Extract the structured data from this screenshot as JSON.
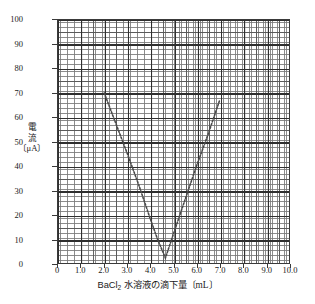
{
  "chart_data": {
    "type": "line",
    "title": "",
    "subtitle": "",
    "xlabel": "BaCl2 水溶液の滴下量〔mL〕",
    "xlabel_main": "BaCl",
    "xlabel_sub": "2",
    "xlabel_rest": " 水溶液の滴下量〔mL〕",
    "ylabel": "電流〔μA〕",
    "ylabel_line1": "電",
    "ylabel_line2": "流",
    "ylabel_line3": "〔μA〕",
    "xlim": [
      0,
      10
    ],
    "ylim": [
      0,
      100
    ],
    "x_major_step": 1.0,
    "y_major_step": 10,
    "x_minor_step": 0.1,
    "y_minor_step": 1,
    "grid": true,
    "grid_style": "graph-paper",
    "legend": false,
    "marker": "dotted-line",
    "line_color": "#4a4a4a",
    "xticklabels": [
      "0",
      "1.0",
      "2.0",
      "3.0",
      "4.0",
      "5.0",
      "6.0",
      "7.0",
      "8.0",
      "9.0",
      "10.0"
    ],
    "xtickvalues": [
      0,
      1,
      2,
      3,
      4,
      5,
      6,
      7,
      8,
      9,
      10
    ],
    "yticklabels": [
      "0",
      "10",
      "20",
      "30",
      "40",
      "50",
      "60",
      "70",
      "80",
      "90",
      "100"
    ],
    "ytickvalues": [
      0,
      10,
      20,
      30,
      40,
      50,
      60,
      70,
      80,
      90,
      100
    ],
    "series": [
      {
        "name": "電流",
        "x": [
          2.0,
          2.5,
          3.0,
          3.5,
          4.0,
          4.3,
          4.65,
          5.0,
          5.5,
          6.0,
          6.5,
          7.0
        ],
        "values": [
          70,
          57.5,
          45,
          32,
          18,
          10,
          2,
          12,
          26,
          40,
          53,
          67
        ]
      }
    ],
    "annotations": []
  }
}
